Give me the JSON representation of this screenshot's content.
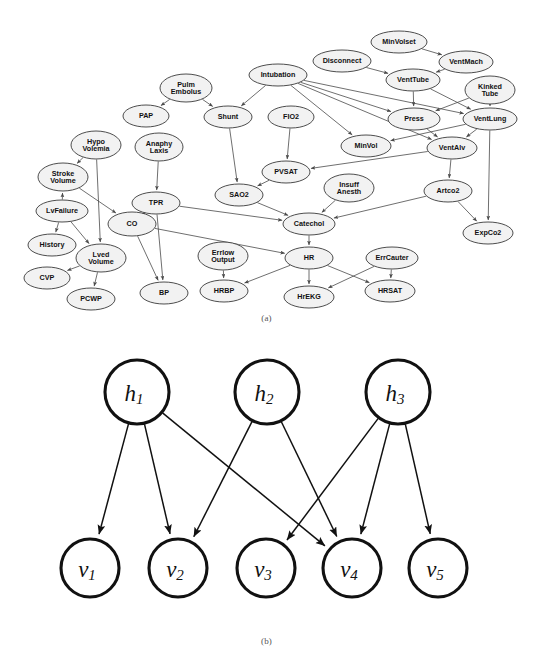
{
  "figure": {
    "caption_a": "(a)",
    "caption_b": "(b)"
  },
  "panel_a": {
    "title": "ALARM Bayesian network",
    "nodes": [
      {
        "id": "MinVolset",
        "label": "MinVolset",
        "lines": [
          "MinVolset"
        ],
        "x": 399,
        "y": 42,
        "rx": 28,
        "ry": 11
      },
      {
        "id": "Disconnect",
        "label": "Disconnect",
        "lines": [
          "Disconnect"
        ],
        "x": 342,
        "y": 61,
        "rx": 29,
        "ry": 11
      },
      {
        "id": "VentMach",
        "label": "VentMach",
        "lines": [
          "VentMach"
        ],
        "x": 466,
        "y": 62,
        "rx": 27,
        "ry": 11
      },
      {
        "id": "Intubation",
        "label": "Intubation",
        "lines": [
          "Intubation"
        ],
        "x": 278,
        "y": 75,
        "rx": 29,
        "ry": 11
      },
      {
        "id": "VentTube",
        "label": "VentTube",
        "lines": [
          "VentTube"
        ],
        "x": 413,
        "y": 80,
        "rx": 27,
        "ry": 11
      },
      {
        "id": "KinkedTube",
        "label": "Kinked Tube",
        "lines": [
          "Kinked",
          "Tube"
        ],
        "x": 490,
        "y": 90,
        "rx": 25,
        "ry": 14
      },
      {
        "id": "PulmEmbolus",
        "label": "Pulm Embolus",
        "lines": [
          "Pulm",
          "Embolus"
        ],
        "x": 186,
        "y": 88,
        "rx": 26,
        "ry": 14
      },
      {
        "id": "PAP",
        "label": "PAP",
        "lines": [
          "PAP"
        ],
        "x": 146,
        "y": 116,
        "rx": 23,
        "ry": 11
      },
      {
        "id": "Shunt",
        "label": "Shunt",
        "lines": [
          "Shunt"
        ],
        "x": 228,
        "y": 117,
        "rx": 24,
        "ry": 11
      },
      {
        "id": "FIO2",
        "label": "FIO2",
        "lines": [
          "FIO2"
        ],
        "x": 291,
        "y": 117,
        "rx": 23,
        "ry": 11
      },
      {
        "id": "Press",
        "label": "Press",
        "lines": [
          "Press"
        ],
        "x": 414,
        "y": 119,
        "rx": 26,
        "ry": 11
      },
      {
        "id": "VentLung",
        "label": "VentLung",
        "lines": [
          "VentLung"
        ],
        "x": 490,
        "y": 119,
        "rx": 27,
        "ry": 11
      },
      {
        "id": "HypoVolemia",
        "label": "Hypo Volemia",
        "lines": [
          "Hypo",
          "Volemia"
        ],
        "x": 96,
        "y": 145,
        "rx": 25,
        "ry": 14
      },
      {
        "id": "AnaphyLaxis",
        "label": "Anaphy Laxis",
        "lines": [
          "Anaphy",
          "Laxis"
        ],
        "x": 159,
        "y": 147,
        "rx": 24,
        "ry": 14
      },
      {
        "id": "MinVol",
        "label": "MinVol",
        "lines": [
          "MinVol"
        ],
        "x": 366,
        "y": 146,
        "rx": 25,
        "ry": 11
      },
      {
        "id": "VentAlv",
        "label": "VentAlv",
        "lines": [
          "VentAlv"
        ],
        "x": 452,
        "y": 148,
        "rx": 25,
        "ry": 11
      },
      {
        "id": "StrokeVolume",
        "label": "Stroke Volume",
        "lines": [
          "Stroke",
          "Volume"
        ],
        "x": 63,
        "y": 177,
        "rx": 25,
        "ry": 14
      },
      {
        "id": "PVSAT",
        "label": "PVSAT",
        "lines": [
          "PVSAT"
        ],
        "x": 286,
        "y": 172,
        "rx": 24,
        "ry": 11
      },
      {
        "id": "InsuffAnesth",
        "label": "Insuff Anesth",
        "lines": [
          "Insuff",
          "Anesth"
        ],
        "x": 349,
        "y": 188,
        "rx": 25,
        "ry": 14
      },
      {
        "id": "Artco2",
        "label": "Artco2",
        "lines": [
          "Artco2"
        ],
        "x": 448,
        "y": 191,
        "rx": 24,
        "ry": 11
      },
      {
        "id": "SAO2",
        "label": "SAO2",
        "lines": [
          "SAO2"
        ],
        "x": 239,
        "y": 195,
        "rx": 24,
        "ry": 11
      },
      {
        "id": "TPR",
        "label": "TPR",
        "lines": [
          "TPR"
        ],
        "x": 156,
        "y": 203,
        "rx": 24,
        "ry": 11
      },
      {
        "id": "LvFailure",
        "label": "LvFailure",
        "lines": [
          "LvFailure"
        ],
        "x": 62,
        "y": 211,
        "rx": 26,
        "ry": 11
      },
      {
        "id": "CO",
        "label": "CO",
        "lines": [
          "CO"
        ],
        "x": 132,
        "y": 224,
        "rx": 24,
        "ry": 12
      },
      {
        "id": "Catechol",
        "label": "Catechol",
        "lines": [
          "Catechol"
        ],
        "x": 309,
        "y": 224,
        "rx": 26,
        "ry": 11
      },
      {
        "id": "ExpCo2",
        "label": "ExpCo2",
        "lines": [
          "ExpCo2"
        ],
        "x": 488,
        "y": 233,
        "rx": 25,
        "ry": 11
      },
      {
        "id": "History",
        "label": "History",
        "lines": [
          "History"
        ],
        "x": 52,
        "y": 245,
        "rx": 24,
        "ry": 11
      },
      {
        "id": "ErrlowOutput",
        "label": "Errlow Output",
        "lines": [
          "Errlow",
          "Output"
        ],
        "x": 223,
        "y": 256,
        "rx": 25,
        "ry": 14
      },
      {
        "id": "HR",
        "label": "HR",
        "lines": [
          "HR"
        ],
        "x": 309,
        "y": 258,
        "rx": 24,
        "ry": 11
      },
      {
        "id": "ErrCauter",
        "label": "ErrCauter",
        "lines": [
          "ErrCauter"
        ],
        "x": 392,
        "y": 258,
        "rx": 26,
        "ry": 11
      },
      {
        "id": "LvedVolume",
        "label": "Lved Volume",
        "lines": [
          "Lved",
          "Volume"
        ],
        "x": 101,
        "y": 258,
        "rx": 25,
        "ry": 14
      },
      {
        "id": "CVP",
        "label": "CVP",
        "lines": [
          "CVP"
        ],
        "x": 47,
        "y": 278,
        "rx": 23,
        "ry": 11
      },
      {
        "id": "HRSAT",
        "label": "HRSAT",
        "lines": [
          "HRSAT"
        ],
        "x": 390,
        "y": 291,
        "rx": 25,
        "ry": 11
      },
      {
        "id": "HRBP",
        "label": "HRBP",
        "lines": [
          "HRBP"
        ],
        "x": 224,
        "y": 291,
        "rx": 24,
        "ry": 11
      },
      {
        "id": "BP",
        "label": "BP",
        "lines": [
          "BP"
        ],
        "x": 164,
        "y": 293,
        "rx": 24,
        "ry": 11
      },
      {
        "id": "PCWP",
        "label": "PCWP",
        "lines": [
          "PCWP"
        ],
        "x": 91,
        "y": 299,
        "rx": 24,
        "ry": 11
      },
      {
        "id": "HrEKG",
        "label": "HrEKG",
        "lines": [
          "HrEKG"
        ],
        "x": 309,
        "y": 297,
        "rx": 25,
        "ry": 11
      }
    ],
    "edges": [
      [
        "MinVolset",
        "VentMach"
      ],
      [
        "VentMach",
        "VentTube"
      ],
      [
        "Disconnect",
        "VentTube"
      ],
      [
        "VentTube",
        "Press"
      ],
      [
        "VentTube",
        "VentLung"
      ],
      [
        "KinkedTube",
        "Press"
      ],
      [
        "KinkedTube",
        "VentLung"
      ],
      [
        "Intubation",
        "Shunt"
      ],
      [
        "Intubation",
        "Press"
      ],
      [
        "Intubation",
        "VentLung"
      ],
      [
        "Intubation",
        "MinVol"
      ],
      [
        "Intubation",
        "VentAlv"
      ],
      [
        "PulmEmbolus",
        "PAP"
      ],
      [
        "PulmEmbolus",
        "Shunt"
      ],
      [
        "Shunt",
        "SAO2"
      ],
      [
        "FIO2",
        "PVSAT"
      ],
      [
        "VentLung",
        "MinVol"
      ],
      [
        "VentLung",
        "VentAlv"
      ],
      [
        "VentLung",
        "ExpCo2"
      ],
      [
        "Press",
        "VentAlv"
      ],
      [
        "VentAlv",
        "PVSAT"
      ],
      [
        "VentAlv",
        "Artco2"
      ],
      [
        "PVSAT",
        "SAO2"
      ],
      [
        "SAO2",
        "Catechol"
      ],
      [
        "TPR",
        "Catechol"
      ],
      [
        "InsuffAnesth",
        "Catechol"
      ],
      [
        "Artco2",
        "Catechol"
      ],
      [
        "Artco2",
        "ExpCo2"
      ],
      [
        "Catechol",
        "HR"
      ],
      [
        "HypoVolemia",
        "StrokeVolume"
      ],
      [
        "HypoVolemia",
        "LvedVolume"
      ],
      [
        "LvFailure",
        "StrokeVolume"
      ],
      [
        "LvFailure",
        "History"
      ],
      [
        "LvFailure",
        "LvedVolume"
      ],
      [
        "StrokeVolume",
        "CO"
      ],
      [
        "AnaphyLaxis",
        "TPR"
      ],
      [
        "TPR",
        "CO"
      ],
      [
        "TPR",
        "BP"
      ],
      [
        "CO",
        "BP"
      ],
      [
        "CO",
        "HR"
      ],
      [
        "LvedVolume",
        "CVP"
      ],
      [
        "LvedVolume",
        "PCWP"
      ],
      [
        "HR",
        "HRBP"
      ],
      [
        "HR",
        "HrEKG"
      ],
      [
        "HR",
        "HRSAT"
      ],
      [
        "ErrlowOutput",
        "HRBP"
      ],
      [
        "ErrCauter",
        "HRSAT"
      ],
      [
        "ErrCauter",
        "HrEKG"
      ]
    ]
  },
  "panel_b": {
    "title": "Bipartite hidden-visible graph",
    "hidden_nodes": [
      {
        "id": "h1",
        "base": "h",
        "sub": "1",
        "x": 137,
        "y": 392,
        "r": 32
      },
      {
        "id": "h2",
        "base": "h",
        "sub": "2",
        "x": 267,
        "y": 392,
        "r": 32
      },
      {
        "id": "h3",
        "base": "h",
        "sub": "3",
        "x": 398,
        "y": 392,
        "r": 32
      }
    ],
    "visible_nodes": [
      {
        "id": "v1",
        "base": "v",
        "sub": "1",
        "x": 90,
        "y": 568,
        "r": 29
      },
      {
        "id": "v2",
        "base": "v",
        "sub": "2",
        "x": 178,
        "y": 568,
        "r": 29
      },
      {
        "id": "v3",
        "base": "v",
        "sub": "3",
        "x": 266,
        "y": 568,
        "r": 29
      },
      {
        "id": "v4",
        "base": "v",
        "sub": "4",
        "x": 352,
        "y": 568,
        "r": 29
      },
      {
        "id": "v5",
        "base": "v",
        "sub": "5",
        "x": 438,
        "y": 568,
        "r": 29
      }
    ],
    "edges": [
      [
        "h1",
        "v1"
      ],
      [
        "h1",
        "v2"
      ],
      [
        "h1",
        "v4"
      ],
      [
        "h2",
        "v2"
      ],
      [
        "h2",
        "v4"
      ],
      [
        "h3",
        "v3"
      ],
      [
        "h3",
        "v4"
      ],
      [
        "h3",
        "v5"
      ]
    ]
  }
}
